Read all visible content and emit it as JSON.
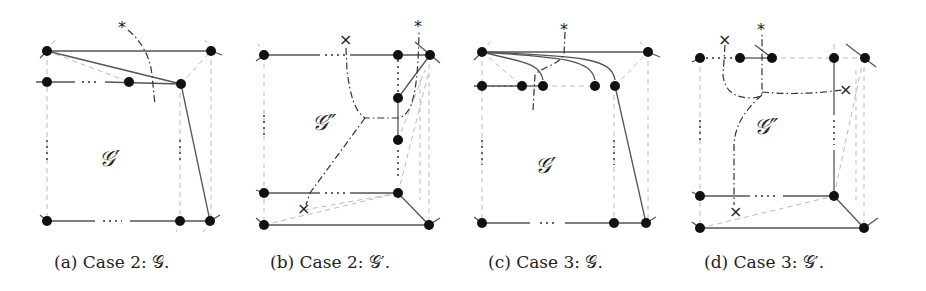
{
  "figure": {
    "panels": [
      {
        "id": "a",
        "caption": "(a) Case 2: 𝒢.",
        "region_label": "𝒢′"
      },
      {
        "id": "b",
        "caption": "(b) Case 2: 𝒢′.",
        "region_label": "𝒢″"
      },
      {
        "id": "c",
        "caption": "(c) Case 3: 𝒢.",
        "region_label": "𝒢′"
      },
      {
        "id": "d",
        "caption": "(d) Case 3: 𝒢′.",
        "region_label": "𝒢″"
      }
    ],
    "markers": {
      "star": "*",
      "cross": "×",
      "ellipsis": "···"
    }
  }
}
